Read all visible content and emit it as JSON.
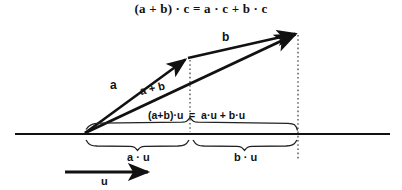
{
  "title": "(a + b) · c = a · c + b · c",
  "labels": {
    "vector_a": "a",
    "vector_b": "b",
    "vector_a_plus_b": "a + b",
    "vector_u": "u",
    "sum_projection": "(a+b)·u  =  a·u + b·u",
    "brace_a_u": "a · u",
    "brace_b_u": "b · u"
  },
  "colors": {
    "ink": "#111111",
    "background": "#ffffff",
    "dotted": "#444444"
  },
  "geometry": {
    "origin": [
      85,
      133
    ],
    "tip_a": [
      188,
      58
    ],
    "tip_sum": [
      298,
      33
    ],
    "axis_y": 134,
    "axis_x_start": 15,
    "axis_x_end": 390,
    "drop_line_a_x": 190,
    "drop_line_sum_x": 298,
    "u_arrow_start": [
      65,
      172
    ],
    "u_arrow_end": [
      152,
      172
    ],
    "upper_brace_span": [
      85,
      298
    ],
    "lower_brace_a_span": [
      85,
      190
    ],
    "lower_brace_b_span": [
      192,
      298
    ]
  }
}
